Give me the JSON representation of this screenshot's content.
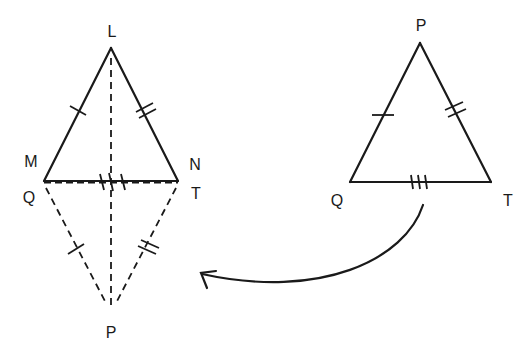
{
  "diagram": {
    "left_figure": {
      "triangle_top": {
        "vertices": {
          "apex": "L",
          "left": "M",
          "right": "N"
        },
        "labels": {
          "L": "L",
          "M": "M",
          "N": "N"
        }
      },
      "triangle_bottom_reflected": {
        "vertices": {
          "apex": "P",
          "left": "Q",
          "right": "T"
        },
        "labels": {
          "Q": "Q",
          "T": "T",
          "P": "P"
        },
        "style": "dashed"
      },
      "axis": "dashed line from L to P",
      "tick_marks": {
        "LM": 1,
        "LN": 2,
        "MN_QT": 3,
        "QP": 1,
        "TP": 2
      }
    },
    "right_figure": {
      "triangle": {
        "vertices": {
          "apex": "P",
          "left": "Q",
          "right": "T"
        },
        "labels": {
          "P": "P",
          "Q": "Q",
          "T": "T"
        }
      },
      "tick_marks": {
        "PQ": 1,
        "PT": 2,
        "QT": 3
      }
    },
    "arrow": {
      "from": "right-triangle",
      "to": "left-figure",
      "style": "curved"
    }
  }
}
